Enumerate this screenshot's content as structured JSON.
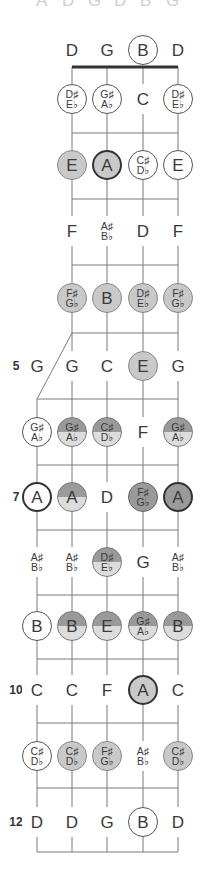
{
  "top_cut_letters": [
    "A",
    "D",
    "G",
    "D",
    "B",
    "G"
  ],
  "strings_x": [
    37,
    72,
    107,
    143,
    178
  ],
  "nut": {
    "y": 67,
    "x1": 72,
    "x2": 178
  },
  "fifth_string": {
    "start_y": 399,
    "diag_from": [
      72,
      333
    ],
    "diag_to": [
      37,
      399
    ]
  },
  "frets_y": [
    133,
    199,
    265,
    333,
    399,
    465,
    530,
    595,
    659,
    723,
    788,
    852
  ],
  "fret_numbers": [
    {
      "label": "5",
      "y": 366
    },
    {
      "label": "7",
      "y": 497
    },
    {
      "label": "10",
      "y": 690
    },
    {
      "label": "12",
      "y": 822
    }
  ],
  "rows": [
    {
      "y": 50,
      "notes": [
        null,
        {
          "t": "D",
          "s": "plain"
        },
        {
          "t": "G",
          "s": "plain"
        },
        {
          "t": "B",
          "s": "circ"
        },
        {
          "t": "D",
          "s": "plain"
        }
      ]
    },
    {
      "y": 99,
      "notes": [
        null,
        {
          "t": "D♯|E♭",
          "s": "circ"
        },
        {
          "t": "G♯|A♭",
          "s": "circ"
        },
        {
          "t": "C",
          "s": "plain"
        },
        {
          "t": "D♯|E♭",
          "s": "circ"
        }
      ]
    },
    {
      "y": 165,
      "notes": [
        null,
        {
          "t": "E",
          "s": "light"
        },
        {
          "t": "A",
          "s": "light darkring"
        },
        {
          "t": "C♯|D♭",
          "s": "circ"
        },
        {
          "t": "E",
          "s": "circ"
        }
      ]
    },
    {
      "y": 231,
      "notes": [
        null,
        {
          "t": "F",
          "s": "plain"
        },
        {
          "t": "A♯|B♭",
          "s": "plain"
        },
        {
          "t": "D",
          "s": "plain"
        },
        {
          "t": "F",
          "s": "plain"
        }
      ]
    },
    {
      "y": 298,
      "notes": [
        null,
        {
          "t": "F♯|G♭",
          "s": "light"
        },
        {
          "t": "B",
          "s": "light"
        },
        {
          "t": "D♯|E♭",
          "s": "light"
        },
        {
          "t": "F♯|G♭",
          "s": "light"
        }
      ]
    },
    {
      "y": 366,
      "notes": [
        {
          "t": "G",
          "s": "plain"
        },
        {
          "t": "G",
          "s": "plain"
        },
        {
          "t": "C",
          "s": "plain"
        },
        {
          "t": "E",
          "s": "light"
        },
        {
          "t": "G",
          "s": "plain"
        }
      ]
    },
    {
      "y": 432,
      "notes": [
        {
          "t": "G♯|A♭",
          "s": "circ"
        },
        {
          "t": "G♯|A♭",
          "s": "half"
        },
        {
          "t": "C♯|D♭",
          "s": "half"
        },
        {
          "t": "F",
          "s": "plain"
        },
        {
          "t": "G♯|A♭",
          "s": "half"
        }
      ]
    },
    {
      "y": 497,
      "notes": [
        {
          "t": "A",
          "s": "circ darkring"
        },
        {
          "t": "A",
          "s": "half darkring"
        },
        {
          "t": "D",
          "s": "plain"
        },
        {
          "t": "F♯|G♭",
          "s": "dark"
        },
        {
          "t": "A",
          "s": "dark darkring"
        }
      ]
    },
    {
      "y": 562,
      "notes": [
        {
          "t": "A♯|B♭",
          "s": "plain"
        },
        {
          "t": "A♯|B♭",
          "s": "plain"
        },
        {
          "t": "D♯|E♭",
          "s": "half"
        },
        {
          "t": "G",
          "s": "plain"
        },
        {
          "t": "A♯|B♭",
          "s": "plain"
        }
      ]
    },
    {
      "y": 626,
      "notes": [
        {
          "t": "B",
          "s": "circ"
        },
        {
          "t": "B",
          "s": "half"
        },
        {
          "t": "E",
          "s": "half"
        },
        {
          "t": "G♯|A♭",
          "s": "half"
        },
        {
          "t": "B",
          "s": "half"
        }
      ]
    },
    {
      "y": 690,
      "notes": [
        {
          "t": "C",
          "s": "plain"
        },
        {
          "t": "C",
          "s": "plain"
        },
        {
          "t": "F",
          "s": "plain"
        },
        {
          "t": "A",
          "s": "light darkring"
        },
        {
          "t": "C",
          "s": "plain"
        }
      ]
    },
    {
      "y": 756,
      "notes": [
        {
          "t": "C♯|D♭",
          "s": "circ"
        },
        {
          "t": "C♯|D♭",
          "s": "light"
        },
        {
          "t": "F♯|G♭",
          "s": "light"
        },
        {
          "t": "A♯|B♭",
          "s": "plain"
        },
        {
          "t": "C♯|D♭",
          "s": "light"
        }
      ]
    },
    {
      "y": 822,
      "notes": [
        {
          "t": "D",
          "s": "plain"
        },
        {
          "t": "D",
          "s": "plain"
        },
        {
          "t": "G",
          "s": "plain"
        },
        {
          "t": "B",
          "s": "circ"
        },
        {
          "t": "D",
          "s": "plain"
        }
      ]
    }
  ],
  "colors": {
    "line": "#7a7a7a",
    "nut": "#333333",
    "light_fill": "#c9c9c9",
    "dark_fill": "#9a9a9a"
  }
}
